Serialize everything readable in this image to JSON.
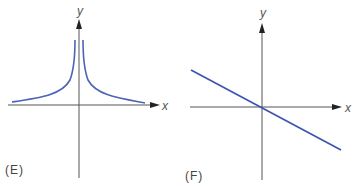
{
  "figures": [
    {
      "id": "E",
      "label": "(E)",
      "x_axis_label": "x",
      "y_axis_label": "y",
      "curve": "reciprocal-squared-like: y = k/|x|, symmetric about y-axis, asymptotic to y-axis and approaching x-axis from above",
      "curve_color": "#4a64b8",
      "axis_color": "#555555"
    },
    {
      "id": "F",
      "label": "(F)",
      "x_axis_label": "x",
      "y_axis_label": "y",
      "curve": "straight line through origin with negative slope",
      "curve_color": "#3b55b0",
      "axis_color": "#555555"
    }
  ]
}
